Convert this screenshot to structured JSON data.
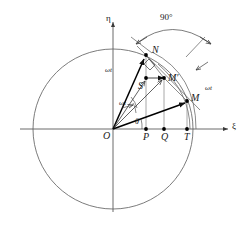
{
  "figure": {
    "type": "vector-diagram",
    "background_color": "#ffffff",
    "line_color": "#3a3a3a",
    "vector_color": "#000000",
    "axes": {
      "x_label": "ξ",
      "y_label": "η",
      "origin_label": "O"
    },
    "angle_labels": {
      "right_angle": "90°",
      "theta": "θ",
      "omega_t": "ωt"
    },
    "points": [
      {
        "name": "O",
        "label": "O",
        "x": 113,
        "y": 129,
        "dot": false
      },
      {
        "name": "N",
        "label": "N",
        "x": 146,
        "y": 55,
        "dot": true
      },
      {
        "name": "S",
        "label": "S",
        "x": 146,
        "y": 78,
        "dot": true
      },
      {
        "name": "Mp",
        "label": "M′",
        "x": 164,
        "y": 78,
        "dot": true
      },
      {
        "name": "M",
        "label": "M",
        "x": 187,
        "y": 101,
        "dot": true
      },
      {
        "name": "P",
        "label": "P",
        "x": 146,
        "y": 129,
        "dot": true
      },
      {
        "name": "Q",
        "label": "Q",
        "x": 164,
        "y": 129,
        "dot": true
      },
      {
        "name": "T",
        "label": "T",
        "x": 187,
        "y": 129,
        "dot": true
      }
    ],
    "omega_labels": [
      {
        "id": "omega-upper",
        "text": "ωt",
        "x": 105,
        "y": 67
      },
      {
        "id": "omega-lower",
        "text": "ωt",
        "x": 118,
        "y": 103
      },
      {
        "id": "omega-right",
        "text": "ωt",
        "x": 205,
        "y": 88
      }
    ],
    "circle": {
      "cx": 113,
      "cy": 129,
      "r": 80
    }
  }
}
